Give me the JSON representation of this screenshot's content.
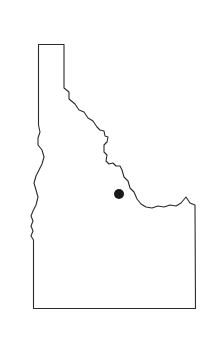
{
  "figure": {
    "title": "Idaho",
    "type": "state-outline-map",
    "background_color": "#ffffff",
    "outline_color": "#2b2b2b",
    "fill_color": "#ffffff",
    "marker_color": "#1a1a1a"
  },
  "chart_data": {
    "type": "map",
    "title": "Idaho",
    "subtitle": "",
    "xlabel": "",
    "ylabel": "",
    "region": "Idaho",
    "projection": "unspecified",
    "grid": false,
    "legend": false,
    "viewbox": [
      0,
      0,
      210,
      343
    ],
    "markers": [
      {
        "name": "city-marker",
        "label": "",
        "x": 119,
        "y": 194,
        "radius": 5,
        "color": "#1a1a1a",
        "shape": "circle"
      }
    ],
    "outline_path": "M 38.5,44.5 L 64,44.5 L 64,88 L 69,92 L 69,99 L 75,104 L 79,110 L 84,112 L 88,118 L 93,121 L 97,127 L 100,130 L 104,131 L 105,136 L 108,137 L 107,142 L 104,145 L 104,152 L 107,155 L 106,161 L 109,164 L 113,163 L 116,166 L 120,166 L 122,170 L 124,177 L 128,181 L 130,188 L 134,192 L 137,199 L 141,204 L 146,207 L 152,208 L 158,206 L 164,207 L 170,205 L 176,206 L 181,203 L 186,197 L 190,203 L 195,205 L 195.5,308.5 L 33.5,308.5 L 33.5,240 L 31,236 L 33,231 L 31,226 L 33,221 L 31,216 L 33,211 L 36,205 L 38,197 L 36,190 L 34,183 L 36,176 L 39,170 L 42,164 L 44,157 L 42,150 L 38,145 L 38,138 L 40,132 L 38.5,125 L 38.5,44.5 Z"
  }
}
